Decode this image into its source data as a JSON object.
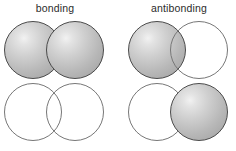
{
  "figure": {
    "title_left": "bonding",
    "title_right": "antibonding",
    "background_color": "#ffffff",
    "shaded_phase_color": "#b8b8b8",
    "open_phase_color": "#ffffff",
    "outline_color": "#4a4a4a",
    "label_color": "#2b2b2b"
  },
  "panels": [
    {
      "name": "bonding",
      "label": "bonding",
      "rows": [
        {
          "name": "top-row",
          "orbitals": [
            {
              "position": "left",
              "phase": "shaded"
            },
            {
              "position": "right",
              "phase": "shaded"
            }
          ]
        },
        {
          "name": "bottom-row",
          "orbitals": [
            {
              "position": "left",
              "phase": "open"
            },
            {
              "position": "right",
              "phase": "open"
            }
          ]
        }
      ]
    },
    {
      "name": "antibonding",
      "label": "antibonding",
      "rows": [
        {
          "name": "top-row",
          "orbitals": [
            {
              "position": "left",
              "phase": "shaded"
            },
            {
              "position": "right",
              "phase": "open"
            }
          ]
        },
        {
          "name": "bottom-row",
          "orbitals": [
            {
              "position": "left",
              "phase": "open"
            },
            {
              "position": "right",
              "phase": "shaded"
            }
          ]
        }
      ]
    }
  ]
}
